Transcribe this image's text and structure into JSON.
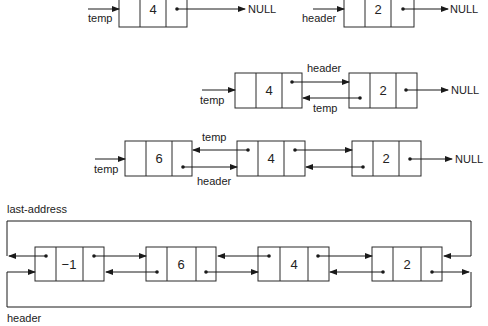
{
  "diagram": {
    "null_label": "NULL",
    "steps": [
      {
        "id": "step1",
        "parts": [
          {
            "pointer": "temp",
            "nodes": [
              "4"
            ],
            "ends_in": "NULL"
          },
          {
            "pointer": "header",
            "nodes": [
              "2"
            ],
            "ends_in": "NULL"
          }
        ]
      },
      {
        "id": "step2",
        "pointer": "temp",
        "nodes": [
          "4",
          "2"
        ],
        "link_labels": {
          "forward": "header",
          "backward": "temp"
        },
        "ends_in": "NULL"
      },
      {
        "id": "step3",
        "pointer": "temp",
        "nodes": [
          "6",
          "4",
          "2"
        ],
        "link_labels": {
          "backward": "temp",
          "forward": "header"
        },
        "ends_in": "NULL"
      },
      {
        "id": "step4-circular",
        "nodes": [
          "−1",
          "6",
          "4",
          "2"
        ],
        "top_loop_label": "last-address",
        "bottom_loop_label": "header"
      }
    ]
  },
  "labels": {
    "temp": "temp",
    "header": "header",
    "null": "NULL",
    "last_address": "last-address"
  },
  "colors": {
    "line": "#1a1a1a",
    "box_stroke": "#2a2a2a",
    "text": "#222222",
    "background": "#ffffff"
  }
}
